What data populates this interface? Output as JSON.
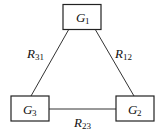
{
  "diagram": {
    "type": "triangle-network",
    "nodes": [
      {
        "id": "G1",
        "letter": "G",
        "sub": "1"
      },
      {
        "id": "G2",
        "letter": "G",
        "sub": "2"
      },
      {
        "id": "G3",
        "letter": "G",
        "sub": "3"
      }
    ],
    "edges": [
      {
        "from": "G3",
        "to": "G1",
        "letter": "R",
        "sub": "31"
      },
      {
        "from": "G1",
        "to": "G2",
        "letter": "R",
        "sub": "12"
      },
      {
        "from": "G2",
        "to": "G3",
        "letter": "R",
        "sub": "23"
      }
    ],
    "colors": {
      "stroke": "#222222",
      "background": "#ffffff"
    }
  }
}
